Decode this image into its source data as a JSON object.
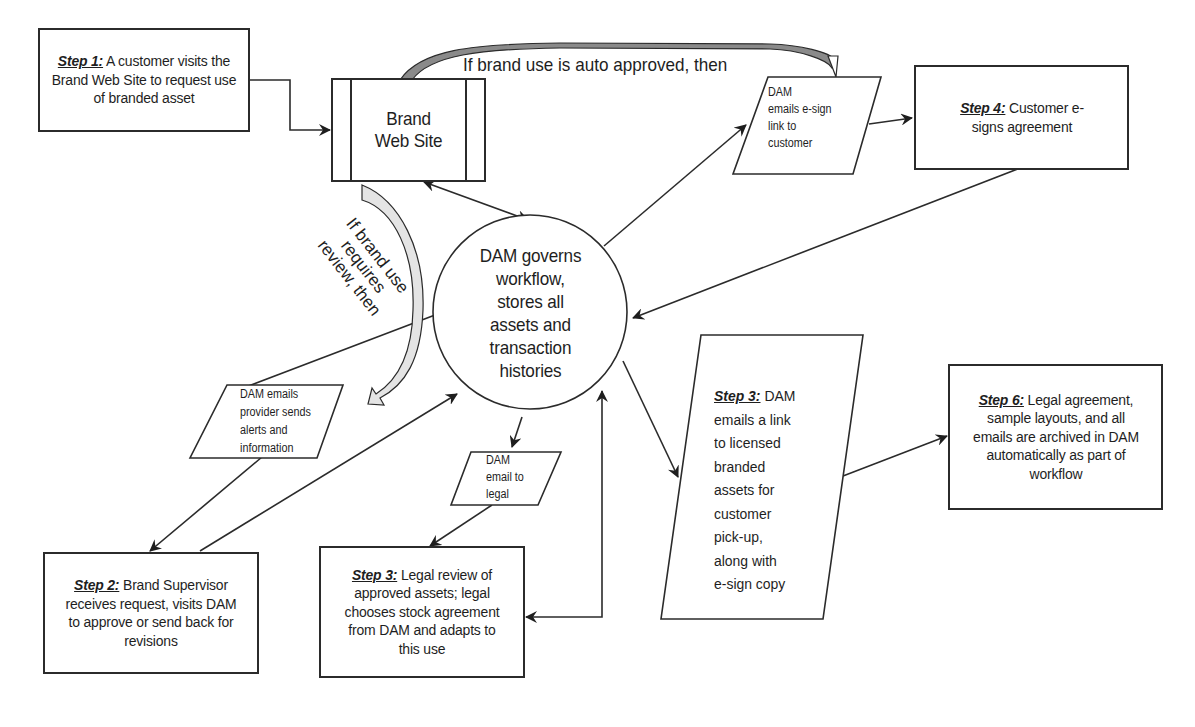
{
  "diagram": {
    "type": "flowchart",
    "nodes": {
      "step1": {
        "step": "Step 1:",
        "text": "A customer visits the Brand Web Site to request use of branded asset"
      },
      "website": {
        "line1": "Brand",
        "line2": "Web Site"
      },
      "dam_core": {
        "lines": [
          "DAM governs",
          "workflow,",
          "stores all",
          "assets and",
          "transaction",
          "histories"
        ]
      },
      "dam_esign_email": {
        "lines": [
          "DAM",
          "emails e-sign",
          "link to",
          "customer"
        ]
      },
      "step4": {
        "step": "Step 4:",
        "text": "Customer e-signs agreement"
      },
      "dam_provider_email": {
        "lines": [
          "DAM emails",
          "provider sends",
          "alerts and",
          "information"
        ]
      },
      "dam_legal_email": {
        "lines": [
          "DAM",
          "email to",
          "legal"
        ]
      },
      "step2": {
        "step": "Step 2:",
        "text": "Brand Supervisor receives request, visits DAM to approve or send back for revisions"
      },
      "step3_legal": {
        "step": "Step 3:",
        "text": "Legal review of approved assets; legal chooses stock agreement from DAM and adapts to this use"
      },
      "step3_dam": {
        "step": "Step 3:",
        "lines": [
          "DAM",
          "emails a link",
          "to licensed",
          "branded",
          "assets for",
          "customer",
          "pick-up,",
          "along with",
          "e-sign copy"
        ]
      },
      "step6": {
        "step": "Step 6:",
        "text": "Legal agreement, sample layouts, and all emails are archived in DAM automatically as part of workflow"
      }
    },
    "labels": {
      "auto_approved": "If brand use is auto approved, then",
      "requires_review": [
        "If brand use",
        "requires",
        "review, then"
      ]
    },
    "edges": [
      {
        "from": "step1",
        "to": "website"
      },
      {
        "from": "website",
        "to": "dam_esign_email",
        "label": "auto_approved"
      },
      {
        "from": "website",
        "to": "dam_provider_email",
        "label": "requires_review"
      },
      {
        "from": "website",
        "to": "dam_core",
        "bidirectional": true
      },
      {
        "from": "dam_core",
        "to": "dam_esign_email"
      },
      {
        "from": "dam_esign_email",
        "to": "step4"
      },
      {
        "from": "step4",
        "to": "dam_core"
      },
      {
        "from": "dam_core",
        "to": "dam_provider_email"
      },
      {
        "from": "dam_provider_email",
        "to": "step2"
      },
      {
        "from": "step2",
        "to": "dam_core"
      },
      {
        "from": "dam_core",
        "to": "dam_legal_email"
      },
      {
        "from": "dam_legal_email",
        "to": "step3_legal"
      },
      {
        "from": "step3_legal",
        "to": "dam_core",
        "bidirectional": true
      },
      {
        "from": "dam_core",
        "to": "step3_dam"
      },
      {
        "from": "step3_dam",
        "to": "step6"
      }
    ]
  }
}
